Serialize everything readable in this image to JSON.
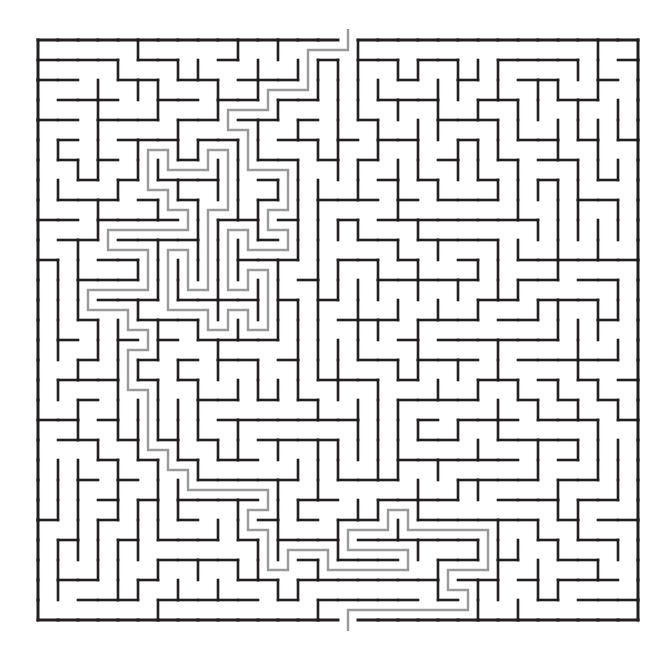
{
  "figure": {
    "kind": "maze",
    "title": "",
    "background_color": "#ffffff",
    "wall_color": "#231f20",
    "solution_color": "#9a9a9a"
  },
  "maze": {
    "columns": 30,
    "rows": 29,
    "cell_size": 20,
    "origin_x": 38,
    "origin_y": 40,
    "width_px": 600,
    "height_px": 580,
    "entrance": {
      "side": "top",
      "column": 15
    },
    "exit": {
      "side": "bottom",
      "column": 15
    },
    "wall_thickness_px": 2.6,
    "border_thickness_px": 3,
    "solution_thickness_px": 2.4,
    "h_walls": [
      "111111111111111101111111111111",
      "010010010001010100001010001001",
      "100101001010100110010010100100",
      "011000100100011001001001001011",
      "100110010010100100110100010100",
      "001001101001011010001011001001",
      "110010010110100101010100110010",
      "001101001001011010101001001101",
      "110010110100100101010110110010",
      "001101001011011010001001001101",
      "010010110100100101110110010010",
      "101101001011011010001001101001",
      "010010110100100101110110010110",
      "101001001011010110001001101001",
      "010110110100101001110010010110",
      "101001001010010110001101101001",
      "010110110101101001010010010010",
      "101001001010010110101101101101",
      "010110110101101001010010010010",
      "001001001010010110101101101101",
      "110110110101101001010010010010",
      "001001001010010110101101101101",
      "110110110101001001010010010010",
      "001001001101110110101101101101",
      "110110110010001001010010010010",
      "001001001101110110101101101101",
      "110110110010001001010010010110",
      "101001001101110110101101101001",
      "010110110010001001010010010110",
      "111111111111111011111111111111"
    ],
    "v_walls": [
      "1010010001001010010010100101001",
      "1001001010100100101001001010101",
      "1100100101001010010100100101011",
      "1001010010100101001010010010101",
      "1010101001010010100101001101001",
      "1001010100101001010010110010101",
      "1100101001010100101001001101011",
      "1001010100101001010110010010101",
      "1010101001010100101001101001011",
      "1001010110101001010110010100101",
      "1100101001010110101001001011001",
      "1001010110101001010110110010101",
      "1010101001010110101001001101001",
      "1001010110101001010110110010101",
      "1100101001010110101001001011011",
      "1001010110101001010110110010101",
      "1010101001010110101001001101001",
      "1001010110101001010110110010101",
      "1100101001010110101001001011001",
      "1001010110101001010110110010101",
      "1010101001010110101001001101011",
      "1001010110101001010110110010101",
      "1100101001010110101001001011001",
      "1001010110101001010110110010101",
      "1010101001010110101001001101011",
      "1001010110101001010110110010101",
      "1100101001010110101001001011001",
      "1001010110101001010110110010101",
      "1010010100101001010010100101001"
    ],
    "solution_cells": [
      [
        15,
        -1
      ],
      [
        15,
        0
      ],
      [
        15,
        1
      ],
      [
        15,
        2
      ],
      [
        15,
        3
      ],
      [
        15,
        4
      ],
      [
        14,
        4
      ],
      [
        13,
        4
      ],
      [
        12,
        4
      ],
      [
        11,
        4
      ],
      [
        11,
        5
      ],
      [
        11,
        6
      ],
      [
        10,
        6
      ],
      [
        10,
        7
      ],
      [
        11,
        7
      ],
      [
        11,
        8
      ],
      [
        12,
        8
      ],
      [
        12,
        9
      ],
      [
        13,
        9
      ],
      [
        14,
        9
      ],
      [
        15,
        9
      ],
      [
        16,
        9
      ],
      [
        17,
        9
      ],
      [
        17,
        8
      ],
      [
        18,
        8
      ],
      [
        19,
        8
      ],
      [
        20,
        8
      ],
      [
        21,
        8
      ],
      [
        22,
        8
      ],
      [
        23,
        8
      ],
      [
        24,
        8
      ],
      [
        25,
        8
      ],
      [
        26,
        8
      ],
      [
        27,
        8
      ],
      [
        28,
        8
      ],
      [
        28,
        9
      ],
      [
        28,
        10
      ],
      [
        28,
        11
      ],
      [
        28,
        12
      ],
      [
        28,
        13
      ],
      [
        28,
        14
      ],
      [
        28,
        15
      ],
      [
        28,
        16
      ],
      [
        28,
        17
      ],
      [
        28,
        18
      ],
      [
        27,
        18
      ],
      [
        27,
        19
      ],
      [
        26,
        19
      ],
      [
        26,
        20
      ],
      [
        27,
        20
      ],
      [
        28,
        20
      ],
      [
        28,
        21
      ],
      [
        28,
        22
      ],
      [
        27,
        22
      ],
      [
        26,
        22
      ],
      [
        25,
        22
      ],
      [
        24,
        22
      ],
      [
        24,
        23
      ],
      [
        24,
        24
      ],
      [
        23,
        24
      ],
      [
        22,
        24
      ],
      [
        21,
        24
      ],
      [
        20,
        24
      ],
      [
        19,
        24
      ],
      [
        18,
        24
      ],
      [
        17,
        24
      ],
      [
        16,
        24
      ],
      [
        16,
        25
      ],
      [
        16,
        26
      ],
      [
        15,
        26
      ],
      [
        15,
        27
      ],
      [
        15,
        28
      ],
      [
        15,
        29
      ]
    ]
  }
}
